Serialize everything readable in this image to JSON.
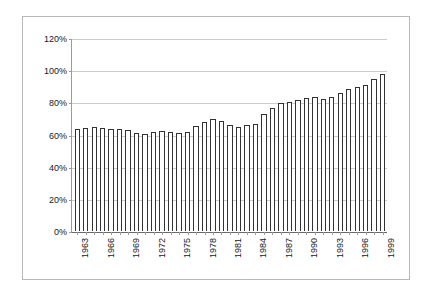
{
  "chart_data": {
    "type": "bar",
    "title": "",
    "subtitle": "",
    "xlabel": "",
    "ylabel": "",
    "ylim": [
      0,
      120
    ],
    "yticks": [
      "0%",
      "20%",
      "40%",
      "60%",
      "80%",
      "100%",
      "120%"
    ],
    "ytick_values": [
      0,
      20,
      40,
      60,
      80,
      100,
      120
    ],
    "grid": true,
    "grid_axis": "y",
    "legend": "none",
    "unit": "%",
    "categories": [
      "1963",
      "1964",
      "1965",
      "1966",
      "1967",
      "1968",
      "1969",
      "1970",
      "1971",
      "1972",
      "1973",
      "1974",
      "1975",
      "1976",
      "1977",
      "1978",
      "1979",
      "1980",
      "1981",
      "1982",
      "1983",
      "1984",
      "1985",
      "1986",
      "1987",
      "1988",
      "1989",
      "1990",
      "1991",
      "1992",
      "1993",
      "1994",
      "1995",
      "1996",
      "1997",
      "1998",
      "1999"
    ],
    "labeled_ticks": [
      "1963",
      "1966",
      "1969",
      "1972",
      "1975",
      "1978",
      "1981",
      "1984",
      "1987",
      "1990",
      "1993",
      "1996",
      "1999"
    ],
    "tick_label_interval": 3,
    "values": [
      64,
      64.5,
      65,
      64.5,
      64,
      63.5,
      63,
      61,
      60.5,
      62,
      62.5,
      62,
      61,
      62,
      65.5,
      68,
      70,
      68.5,
      66,
      65,
      66,
      67,
      73,
      77,
      80,
      80.5,
      82,
      83,
      83.5,
      82.5,
      83.5,
      86,
      89,
      90,
      91.5,
      95,
      98
    ],
    "colors": {
      "bar_fill": "#ffffff",
      "bar_border": "#333333",
      "gridline": "#cccccc",
      "axis": "#9a9a9a",
      "frame": "#b9b9b9",
      "text": "#1a1a1a",
      "background": "#ffffff"
    }
  }
}
